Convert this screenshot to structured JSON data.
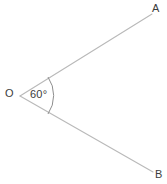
{
  "figure": {
    "canvas": {
      "width": 167,
      "height": 184,
      "background_color": "#ffffff"
    },
    "colors": {
      "ray_stroke": "#b9b9b9",
      "arc_stroke": "#8e8e8e",
      "label_text": "#3c3c3c"
    },
    "vertex": {
      "label": "O",
      "x": 20,
      "y": 96
    },
    "rays": [
      {
        "name": "ray-oa",
        "endpoint_label": "A",
        "from_x": 20,
        "from_y": 96,
        "to_x": 152,
        "to_y": 14
      },
      {
        "name": "ray-ob",
        "endpoint_label": "B",
        "from_x": 20,
        "from_y": 96,
        "to_x": 153,
        "to_y": 172
      }
    ],
    "angle": {
      "value": 60,
      "unit": "degrees",
      "label": "60°",
      "arc_radius": 33,
      "arc_start_x": 48,
      "arc_start_y": 77,
      "arc_end_x": 48,
      "arc_end_y": 114
    }
  }
}
